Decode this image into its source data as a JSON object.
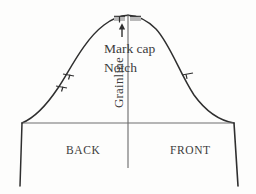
{
  "diagram": {
    "background_color": "#fdfdfc",
    "line_color": "#2f2f2f",
    "text_color": "#3b3b3b",
    "labels": {
      "mark_cap": "Mark cap",
      "notch": "Notch",
      "grainline": "Grainline",
      "back": "BACK",
      "front": "FRONT"
    },
    "markings": {
      "apex_arrow": "up-arrow-icon",
      "cap_notch_left": "cap-notch-mark",
      "cap_notch_right": "cap-notch-mark",
      "back_double_notch": "double-notch-mark",
      "front_single_notch": "single-notch-mark"
    },
    "geometry": {
      "bicep_line_y": 123,
      "left_corner_x": 22,
      "right_corner_x": 234,
      "apex_x": 128,
      "apex_y": 15,
      "grainline_bottom_y": 168,
      "hem_bottom_y": 186
    }
  }
}
